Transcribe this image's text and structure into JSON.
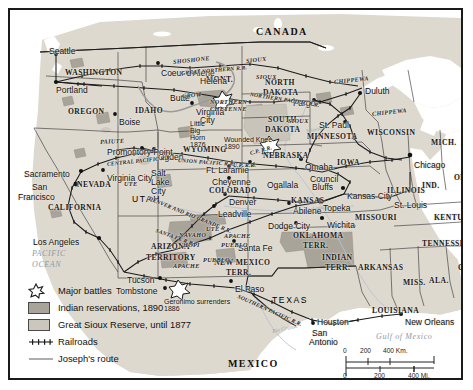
{
  "map": {
    "title": "Western Expansion and Indian Wars, United States",
    "countries": [
      {
        "name": "CANADA",
        "x": 246,
        "y": 16
      },
      {
        "name": "MEXICO",
        "x": 218,
        "y": 348
      }
    ],
    "water_labels": [
      {
        "name": "PACIFIC",
        "x": 22,
        "y": 239
      },
      {
        "name": "OCEAN",
        "x": 22,
        "y": 250
      },
      {
        "name": "Gulf of Mexico",
        "x": 366,
        "y": 322
      }
    ],
    "rivers": [
      {
        "name": "Arkansas",
        "x": 297,
        "y": 197
      },
      {
        "name": "Rio Grande",
        "x": 262,
        "y": 318
      },
      {
        "name": "Missouri",
        "x": 296,
        "y": 118
      }
    ],
    "states": [
      {
        "name": "WASHINGTON",
        "x": 55,
        "y": 58,
        "cls": "state"
      },
      {
        "name": "OREGON",
        "x": 58,
        "y": 97,
        "cls": "state"
      },
      {
        "name": "IDAHO",
        "x": 125,
        "y": 96,
        "cls": "state"
      },
      {
        "name": "MONT.",
        "x": 196,
        "y": 65,
        "cls": "state"
      },
      {
        "name": "NORTH",
        "x": 255,
        "y": 68,
        "cls": "state"
      },
      {
        "name": "DAKOTA",
        "x": 253,
        "y": 78,
        "cls": "state"
      },
      {
        "name": "SOUTH",
        "x": 258,
        "y": 105,
        "cls": "state"
      },
      {
        "name": "DAKOTA",
        "x": 255,
        "y": 115,
        "cls": "state"
      },
      {
        "name": "MINNESOTA",
        "x": 297,
        "y": 122,
        "cls": "state"
      },
      {
        "name": "WISCONSIN",
        "x": 357,
        "y": 118,
        "cls": "state"
      },
      {
        "name": "MICH.",
        "x": 421,
        "y": 128,
        "cls": "state"
      },
      {
        "name": "NEBRASKA",
        "x": 253,
        "y": 141,
        "cls": "state"
      },
      {
        "name": "IOWA",
        "x": 327,
        "y": 148,
        "cls": "state"
      },
      {
        "name": "ILLINOIS",
        "x": 377,
        "y": 176,
        "cls": "state"
      },
      {
        "name": "IND.",
        "x": 412,
        "y": 171,
        "cls": "state"
      },
      {
        "name": "OHIO",
        "x": 444,
        "y": 163,
        "cls": "state"
      },
      {
        "name": "WYOMING",
        "x": 173,
        "y": 135,
        "cls": "state"
      },
      {
        "name": "COLORADO",
        "x": 199,
        "y": 176,
        "cls": "state"
      },
      {
        "name": "KANSAS",
        "x": 281,
        "y": 186,
        "cls": "state"
      },
      {
        "name": "MISSOURI",
        "x": 345,
        "y": 203,
        "cls": "state"
      },
      {
        "name": "KENTUCKY",
        "x": 424,
        "y": 203,
        "cls": "state"
      },
      {
        "name": "TENNESSEE",
        "x": 412,
        "y": 229,
        "cls": "state"
      },
      {
        "name": "NEVADA",
        "x": 67,
        "y": 170,
        "cls": "state"
      },
      {
        "name": "UTAH",
        "x": 122,
        "y": 184,
        "cls": "state-lg"
      },
      {
        "name": "CALIFORNIA",
        "x": 38,
        "y": 193,
        "cls": "state"
      },
      {
        "name": "ARIZONA",
        "x": 141,
        "y": 232,
        "cls": "state"
      },
      {
        "name": "TERRITORY",
        "x": 136,
        "y": 243,
        "cls": "state"
      },
      {
        "name": "NEW MEXICO",
        "x": 204,
        "y": 248,
        "cls": "state"
      },
      {
        "name": "TERR.",
        "x": 216,
        "y": 258,
        "cls": "state"
      },
      {
        "name": "OKLAHOMA",
        "x": 283,
        "y": 221,
        "cls": "state"
      },
      {
        "name": "TERR.",
        "x": 293,
        "y": 231,
        "cls": "state"
      },
      {
        "name": "INDIAN",
        "x": 312,
        "y": 243,
        "cls": "state"
      },
      {
        "name": "TERR.",
        "x": 315,
        "y": 253,
        "cls": "state"
      },
      {
        "name": "ARKANSAS",
        "x": 348,
        "y": 253,
        "cls": "state"
      },
      {
        "name": "TEXAS",
        "x": 262,
        "y": 285,
        "cls": "state-lg"
      },
      {
        "name": "LOUISIANA",
        "x": 362,
        "y": 296,
        "cls": "state"
      },
      {
        "name": "MISS.",
        "x": 393,
        "y": 268,
        "cls": "state"
      },
      {
        "name": "ALA.",
        "x": 419,
        "y": 266,
        "cls": "state"
      },
      {
        "name": "GA.",
        "x": 448,
        "y": 253,
        "cls": "state"
      }
    ],
    "cities": [
      {
        "name": "Seattle",
        "x": 39,
        "y": 36,
        "dx": 46,
        "dy": 43
      },
      {
        "name": "Portland",
        "x": 46,
        "y": 75,
        "dx": 43,
        "dy": 72
      },
      {
        "name": "Boise",
        "x": 109,
        "y": 107,
        "dx": 105,
        "dy": 104
      },
      {
        "name": "Coeur d'Alene",
        "x": 151,
        "y": 58,
        "dx": 148,
        "dy": 53
      },
      {
        "name": "Helena",
        "x": 190,
        "y": 66,
        "dx": 184,
        "dy": 63
      },
      {
        "name": "Butte",
        "x": 160,
        "y": 83,
        "dx": 176,
        "dy": 87
      },
      {
        "name": "Virginia",
        "x": 186,
        "y": 97,
        "dx": 182,
        "dy": 93
      },
      {
        "name": "City",
        "x": 190,
        "y": 105,
        "dx": 0,
        "dy": 0
      },
      {
        "name": "Duluth",
        "x": 355,
        "y": 76,
        "dx": 350,
        "dy": 83
      },
      {
        "name": "Fargo",
        "x": 283,
        "y": 88,
        "dx": 304,
        "dy": 90
      },
      {
        "name": "St. Paul",
        "x": 309,
        "y": 110,
        "dx": 335,
        "dy": 112
      },
      {
        "name": "Chicago",
        "x": 404,
        "y": 150,
        "dx": 400,
        "dy": 145
      },
      {
        "name": "Omaha",
        "x": 295,
        "y": 152,
        "dx": 291,
        "dy": 149
      },
      {
        "name": "Council",
        "x": 300,
        "y": 164,
        "dx": 0,
        "dy": 0
      },
      {
        "name": "Bluffs",
        "x": 302,
        "y": 172,
        "dx": 0,
        "dy": 0
      },
      {
        "name": "Kansas City",
        "x": 337,
        "y": 181,
        "dx": 333,
        "dy": 178
      },
      {
        "name": "St. Louis",
        "x": 384,
        "y": 190,
        "dx": 379,
        "dy": 187
      },
      {
        "name": "Topeka",
        "x": 313,
        "y": 193,
        "dx": 309,
        "dy": 190
      },
      {
        "name": "Abilene",
        "x": 283,
        "y": 196,
        "dx": 279,
        "dy": 193
      },
      {
        "name": "Wichita",
        "x": 317,
        "y": 210,
        "dx": 312,
        "dy": 208
      },
      {
        "name": "Dodge City",
        "x": 258,
        "y": 211,
        "dx": 286,
        "dy": 213
      },
      {
        "name": "Ogallala",
        "x": 257,
        "y": 170,
        "dx": 0,
        "dy": 0
      },
      {
        "name": "Denver",
        "x": 219,
        "y": 187,
        "dx": 215,
        "dy": 184
      },
      {
        "name": "Leadville",
        "x": 208,
        "y": 199,
        "dx": 204,
        "dy": 196
      },
      {
        "name": "Cheyenne",
        "x": 202,
        "y": 167,
        "dx": 0,
        "dy": 0
      },
      {
        "name": "Ft. Laramie",
        "x": 196,
        "y": 155,
        "dx": 0,
        "dy": 0
      },
      {
        "name": "Ogden",
        "x": 148,
        "y": 142,
        "dx": 144,
        "dy": 139
      },
      {
        "name": "Salt",
        "x": 141,
        "y": 158,
        "dx": 0,
        "dy": 0
      },
      {
        "name": "Lake",
        "x": 141,
        "y": 167,
        "dx": 0,
        "dy": 0
      },
      {
        "name": "City",
        "x": 141,
        "y": 176,
        "dx": 0,
        "dy": 0
      },
      {
        "name": "Promontory Point",
        "x": 97,
        "y": 137,
        "dx": 0,
        "dy": 0
      },
      {
        "name": "Virginia City",
        "x": 97,
        "y": 163,
        "dx": 93,
        "dy": 160
      },
      {
        "name": "Sacramento",
        "x": 14,
        "y": 159,
        "dx": 71,
        "dy": 161
      },
      {
        "name": "San",
        "x": 22,
        "y": 172,
        "dx": 66,
        "dy": 174
      },
      {
        "name": "Francisco",
        "x": 8,
        "y": 182,
        "dx": 0,
        "dy": 0
      },
      {
        "name": "Los Angeles",
        "x": 23,
        "y": 227,
        "dx": 89,
        "dy": 228
      },
      {
        "name": "Tucson",
        "x": 117,
        "y": 265,
        "dx": 150,
        "dy": 268
      },
      {
        "name": "Tombstone",
        "x": 106,
        "y": 276,
        "dx": 155,
        "dy": 278
      },
      {
        "name": "Santa Fe",
        "x": 228,
        "y": 233,
        "dx": 224,
        "dy": 231
      },
      {
        "name": "El Paso",
        "x": 225,
        "y": 274,
        "dx": 221,
        "dy": 271
      },
      {
        "name": "Houston",
        "x": 307,
        "y": 307,
        "dx": 303,
        "dy": 313
      },
      {
        "name": "San",
        "x": 302,
        "y": 318,
        "dx": 0,
        "dy": 0
      },
      {
        "name": "Antonio",
        "x": 299,
        "y": 327,
        "dx": 0,
        "dy": 0
      },
      {
        "name": "New Orleans",
        "x": 395,
        "y": 307,
        "dx": 391,
        "dy": 304
      }
    ],
    "tribes": [
      {
        "name": "SHOSHONE",
        "x": 163,
        "y": 48,
        "rot": -6
      },
      {
        "name": "SIOUX",
        "x": 236,
        "y": 47,
        "rot": -6
      },
      {
        "name": "SIOUX",
        "x": 246,
        "y": 63,
        "rot": 0
      },
      {
        "name": "CROW",
        "x": 172,
        "y": 82,
        "rot": -4
      },
      {
        "name": "NORTHERN",
        "x": 200,
        "y": 88,
        "rot": 0
      },
      {
        "name": "CHEYENNE",
        "x": 200,
        "y": 95,
        "rot": 0
      },
      {
        "name": "SIOUX",
        "x": 278,
        "y": 107,
        "rot": 0
      },
      {
        "name": "CHIPPEWA",
        "x": 324,
        "y": 68,
        "rot": -6
      },
      {
        "name": "CHIPPEWA",
        "x": 362,
        "y": 100,
        "rot": -6
      },
      {
        "name": "PAIUTE",
        "x": 90,
        "y": 128,
        "rot": -3
      },
      {
        "name": "UTE",
        "x": 114,
        "y": 170,
        "rot": 0
      },
      {
        "name": "UTE",
        "x": 196,
        "y": 215,
        "rot": 0
      },
      {
        "name": "NAVAHO",
        "x": 169,
        "y": 221,
        "rot": 0
      },
      {
        "name": "HOPI",
        "x": 173,
        "y": 231,
        "rot": 0
      },
      {
        "name": "APACHE",
        "x": 214,
        "y": 222,
        "rot": 0
      },
      {
        "name": "PUEBLO",
        "x": 211,
        "y": 231,
        "rot": 0
      },
      {
        "name": "PUEBLO",
        "x": 193,
        "y": 246,
        "rot": 0
      },
      {
        "name": "APACHE",
        "x": 163,
        "y": 252,
        "rot": 0
      }
    ],
    "railroads": [
      {
        "name": "GREAT NORTHERN R.R.",
        "x": 171,
        "y": 60,
        "rot": -5
      },
      {
        "name": "NORTHERN PACIFIC R.R.",
        "x": 240,
        "y": 81,
        "rot": 9
      },
      {
        "name": "UNION PACIFIC R.R.",
        "x": 168,
        "y": 147,
        "rot": 4
      },
      {
        "name": "CENTRAL PACIFIC R.R.",
        "x": 97,
        "y": 151,
        "rot": -6
      },
      {
        "name": "DENVER AND RIO GRANDE R.R.",
        "x": 139,
        "y": 185,
        "rot": 22
      },
      {
        "name": "SANTA FE R.R.",
        "x": 146,
        "y": 217,
        "rot": 20
      },
      {
        "name": "SOUTHERN PACIFIC R.R.",
        "x": 228,
        "y": 283,
        "rot": 24
      },
      {
        "name": "U.P. R.R.",
        "x": 223,
        "y": 152,
        "rot": 0
      },
      {
        "name": "C.P. R.R.",
        "x": 240,
        "y": 140,
        "rot": -15
      }
    ],
    "battles": [
      {
        "name": "Little Big Horn",
        "year": "1876",
        "sx": 212,
        "sy": 88,
        "lx": 180,
        "ly": 110
      },
      {
        "name": "Wounded Knee",
        "year": "1890",
        "sx": 259,
        "sy": 133,
        "lx": 214,
        "ly": 126
      },
      {
        "name": "Geronimo surrenders",
        "year": "1886",
        "sx": 168,
        "sy": 277,
        "lx": 154,
        "ly": 288
      }
    ]
  },
  "legend": {
    "title": "Legend",
    "items": [
      {
        "key": "battle-star-icon",
        "label": "Major battles"
      },
      {
        "key": "dark-swatch-icon",
        "label": "Indian reservations, 1890"
      },
      {
        "key": "light-swatch-icon",
        "label": "Great Sioux Reserve, until 1877"
      },
      {
        "key": "railroad-line-icon",
        "label": "Railroads"
      },
      {
        "key": "route-line-icon",
        "label": "Joseph's route"
      }
    ]
  },
  "scale": {
    "km_ticks": [
      "0",
      "200",
      "400 Km."
    ],
    "mi_ticks": [
      "0",
      "200",
      "400 Mi."
    ]
  },
  "colors": {
    "land": "#ded9cf",
    "ocean": "#ffffff",
    "reservation_dark": "#a9a49a",
    "sioux_reserve_light": "#c9c4ba",
    "border": "#1a1a1a",
    "railroad": "#1a1a1a",
    "joseph_route": "#9a9a9a",
    "water_text": "#8d9aa6"
  }
}
